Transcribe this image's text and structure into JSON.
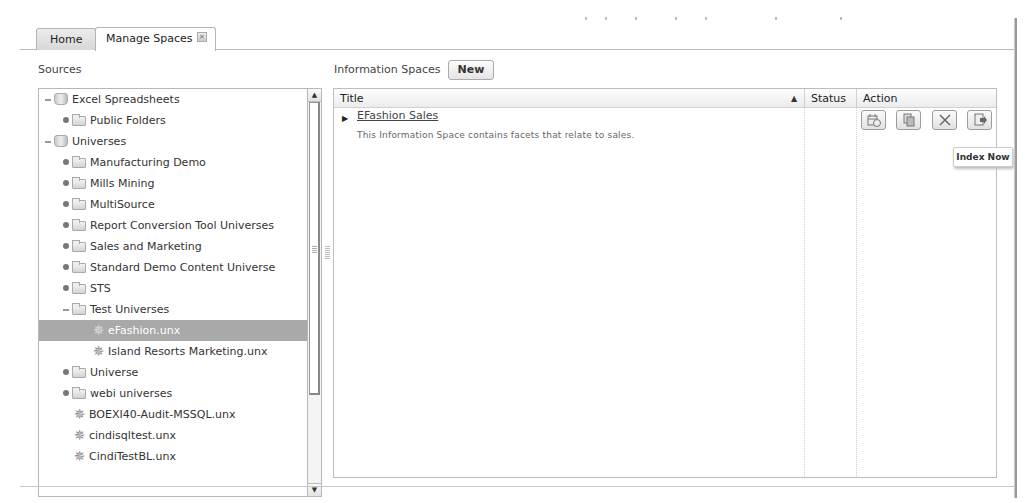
{
  "tabs": [
    {
      "label": "Home",
      "active": false
    },
    {
      "label": "Manage Spaces",
      "active": true,
      "closable": true,
      "close_icon": "close-icon"
    }
  ],
  "sources": {
    "label": "Sources",
    "tree": [
      {
        "label": "Excel Spreadsheets",
        "level": 0,
        "toggle": "collapse",
        "icon": "database-icon"
      },
      {
        "label": "Public Folders",
        "level": 1,
        "toggle": "expand",
        "icon": "folder-icon"
      },
      {
        "label": "Universes",
        "level": 0,
        "toggle": "collapse",
        "icon": "database-icon"
      },
      {
        "label": "Manufacturing Demo",
        "level": 1,
        "toggle": "expand",
        "icon": "folder-icon"
      },
      {
        "label": "Mills Mining",
        "level": 1,
        "toggle": "expand",
        "icon": "folder-icon"
      },
      {
        "label": "MultiSource",
        "level": 1,
        "toggle": "expand",
        "icon": "folder-icon"
      },
      {
        "label": "Report Conversion Tool Universes",
        "level": 1,
        "toggle": "expand",
        "icon": "folder-icon"
      },
      {
        "label": "Sales and Marketing",
        "level": 1,
        "toggle": "expand",
        "icon": "folder-icon"
      },
      {
        "label": "Standard Demo Content Universe",
        "level": 1,
        "toggle": "expand",
        "icon": "folder-icon"
      },
      {
        "label": "STS",
        "level": 1,
        "toggle": "expand",
        "icon": "folder-icon"
      },
      {
        "label": "Test Universes",
        "level": 1,
        "toggle": "collapse",
        "icon": "folder-icon"
      },
      {
        "label": "eFashion.unx",
        "level": 2,
        "toggle": null,
        "icon": "universe-icon",
        "selected": true
      },
      {
        "label": "Island Resorts Marketing.unx",
        "level": 2,
        "toggle": null,
        "icon": "universe-icon"
      },
      {
        "label": "Universe",
        "level": 1,
        "toggle": "expand",
        "icon": "folder-icon"
      },
      {
        "label": "webi universes",
        "level": 1,
        "toggle": "expand",
        "icon": "folder-icon"
      },
      {
        "label": "BOEXI40-Audit-MSSQL.unx",
        "level": 1,
        "toggle": null,
        "icon": "universe-icon"
      },
      {
        "label": "cindisqltest.unx",
        "level": 1,
        "toggle": null,
        "icon": "universe-icon"
      },
      {
        "label": "CindiTestBL.unx",
        "level": 1,
        "toggle": null,
        "icon": "universe-icon"
      }
    ]
  },
  "information_spaces": {
    "label": "Information Spaces",
    "new_button": "New",
    "columns": {
      "title": "Title",
      "status": "Status",
      "action": "Action",
      "sort_indicator": "▲"
    },
    "rows": [
      {
        "title": "EFashion Sales",
        "description": "This Information Space contains facets that relate to sales.",
        "status": "",
        "actions": [
          {
            "name": "schedule-button",
            "icon": "schedule-icon"
          },
          {
            "name": "copy-button",
            "icon": "copy-icon"
          },
          {
            "name": "delete-button",
            "icon": "delete-icon"
          },
          {
            "name": "index-now-button",
            "icon": "index-now-icon"
          }
        ]
      }
    ],
    "tooltip": "Index Now"
  },
  "colors": {
    "selected_row_bg": "#a9a9a9",
    "border": "#b7b7b7",
    "text": "#333333"
  }
}
